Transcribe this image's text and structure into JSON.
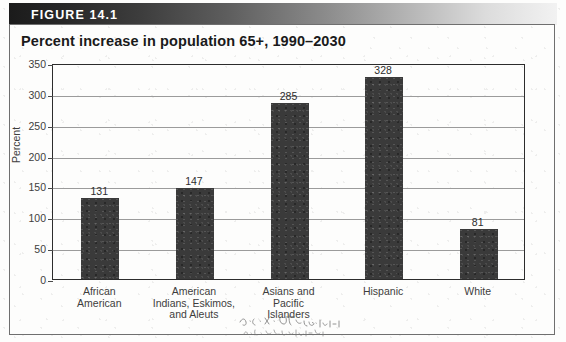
{
  "figure": {
    "banner_label": "FIGURE 14.1",
    "title": "Percent increase in population 65+, 1990–2030"
  },
  "annotation": {
    "kind": "handwritten-pencil-scribble",
    "legible": false,
    "note": ""
  },
  "chart_data": {
    "type": "bar",
    "title": "Percent increase in population 65+, 1990–2030",
    "xlabel": "",
    "ylabel": "Percent",
    "ylim": [
      0,
      350
    ],
    "ytick_step": 50,
    "yticks": [
      0,
      50,
      100,
      150,
      200,
      250,
      300,
      350
    ],
    "ytick_labels": [
      "0",
      "50",
      "100",
      "150",
      "200",
      "250",
      "300",
      "350"
    ],
    "grid": true,
    "legend": false,
    "bar_color": "#3a3a3a",
    "categories": [
      "African American",
      "American Indians, Eskimos, and Aleuts",
      "Asians and Pacific Islanders",
      "Hispanic",
      "White"
    ],
    "category_label_lines": [
      [
        "African",
        "American"
      ],
      [
        "American",
        "Indians, Eskimos,",
        "and Aleuts"
      ],
      [
        "Asians and",
        "Pacific",
        "Islanders"
      ],
      [
        "Hispanic"
      ],
      [
        "White"
      ]
    ],
    "values": [
      131,
      147,
      285,
      328,
      81
    ],
    "value_labels": [
      "131",
      "147",
      "285",
      "328",
      "81"
    ]
  }
}
